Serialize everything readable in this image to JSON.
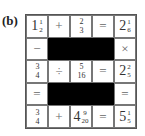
{
  "label": "(b)",
  "grid": {
    "rows": [
      [
        {
          "type": "mixed",
          "whole": "1",
          "num": "1",
          "den": "2"
        },
        {
          "type": "op",
          "text": "+"
        },
        {
          "type": "frac",
          "num": "2",
          "den": "3"
        },
        {
          "type": "op",
          "text": "="
        },
        {
          "type": "mixed",
          "whole": "2",
          "num": "1",
          "den": "6"
        }
      ],
      [
        {
          "type": "op",
          "text": "−"
        },
        {
          "type": "black"
        },
        {
          "type": "black"
        },
        {
          "type": "black"
        },
        {
          "type": "op",
          "text": "×"
        }
      ],
      [
        {
          "type": "frac",
          "num": "3",
          "den": "4"
        },
        {
          "type": "op",
          "text": "÷"
        },
        {
          "type": "frac",
          "num": "5",
          "den": "16"
        },
        {
          "type": "op",
          "text": "="
        },
        {
          "type": "mixed",
          "whole": "2",
          "num": "2",
          "den": "5"
        }
      ],
      [
        {
          "type": "op",
          "text": "="
        },
        {
          "type": "black"
        },
        {
          "type": "black"
        },
        {
          "type": "black"
        },
        {
          "type": "op",
          "text": "="
        }
      ],
      [
        {
          "type": "frac",
          "num": "3",
          "den": "4"
        },
        {
          "type": "op",
          "text": "+"
        },
        {
          "type": "mixed",
          "whole": "4",
          "num": "9",
          "den": "20"
        },
        {
          "type": "op",
          "text": "="
        },
        {
          "type": "mixed",
          "whole": "5",
          "num": "1",
          "den": "5"
        }
      ]
    ]
  }
}
